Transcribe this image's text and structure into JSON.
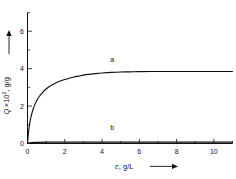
{
  "chart_data": {
    "type": "line",
    "title": "",
    "xlabel": "c, g/L",
    "ylabel": "Q ×10², g/g",
    "ylabel_symbol": "Q",
    "ylabel_factor": "×10",
    "ylabel_exponent": "2",
    "ylabel_units": ", g/g",
    "xlabel_symbol": "c",
    "xlabel_units": ", g/L",
    "xlim": [
      0,
      11
    ],
    "ylim": [
      0,
      7
    ],
    "xticks": [
      0,
      2,
      4,
      6,
      8,
      10
    ],
    "xtick_labels": [
      "0",
      "2",
      "4",
      "6",
      "8",
      "10"
    ],
    "xminor_ticks": [
      1,
      3,
      5,
      7,
      9,
      11
    ],
    "yticks": [
      0,
      2,
      4,
      6
    ],
    "ytick_labels": [
      "0",
      "2",
      "4",
      "6"
    ],
    "yminor_ticks": [
      1,
      3,
      5,
      7
    ],
    "grid": false,
    "legend_position": "inline-annotations",
    "annotations": [
      {
        "text": "a",
        "x": 4.55,
        "y": 4.35
      },
      {
        "text": "b",
        "x": 4.55,
        "y": 0.72
      }
    ],
    "series": [
      {
        "name": "a",
        "label": "a",
        "color": "#111111",
        "plateau": 3.85,
        "points": [
          [
            0.0,
            0.0
          ],
          [
            0.05,
            0.55
          ],
          [
            0.1,
            0.95
          ],
          [
            0.15,
            1.25
          ],
          [
            0.2,
            1.48
          ],
          [
            0.3,
            1.83
          ],
          [
            0.4,
            2.09
          ],
          [
            0.5,
            2.3
          ],
          [
            0.6,
            2.47
          ],
          [
            0.8,
            2.72
          ],
          [
            1.0,
            2.91
          ],
          [
            1.2,
            3.06
          ],
          [
            1.4,
            3.17
          ],
          [
            1.6,
            3.27
          ],
          [
            1.8,
            3.35
          ],
          [
            2.0,
            3.42
          ],
          [
            2.25,
            3.49
          ],
          [
            2.5,
            3.55
          ],
          [
            2.75,
            3.6
          ],
          [
            3.0,
            3.65
          ],
          [
            3.25,
            3.69
          ],
          [
            3.5,
            3.72
          ],
          [
            3.75,
            3.75
          ],
          [
            4.0,
            3.77
          ],
          [
            4.5,
            3.8
          ],
          [
            5.0,
            3.82
          ],
          [
            5.5,
            3.83
          ],
          [
            6.0,
            3.84
          ],
          [
            7.0,
            3.85
          ],
          [
            8.0,
            3.85
          ],
          [
            9.0,
            3.85
          ],
          [
            10.0,
            3.85
          ],
          [
            11.0,
            3.85
          ]
        ]
      },
      {
        "name": "b",
        "label": "b",
        "color": "#111111",
        "plateau": 0.07,
        "points": [
          [
            0.0,
            0.0
          ],
          [
            0.2,
            0.05
          ],
          [
            0.5,
            0.06
          ],
          [
            1.0,
            0.07
          ],
          [
            2.0,
            0.07
          ],
          [
            3.0,
            0.07
          ],
          [
            4.0,
            0.07
          ],
          [
            5.0,
            0.07
          ],
          [
            6.0,
            0.07
          ],
          [
            7.0,
            0.07
          ],
          [
            8.0,
            0.07
          ],
          [
            9.0,
            0.07
          ],
          [
            10.0,
            0.07
          ],
          [
            11.0,
            0.07
          ]
        ]
      }
    ]
  }
}
